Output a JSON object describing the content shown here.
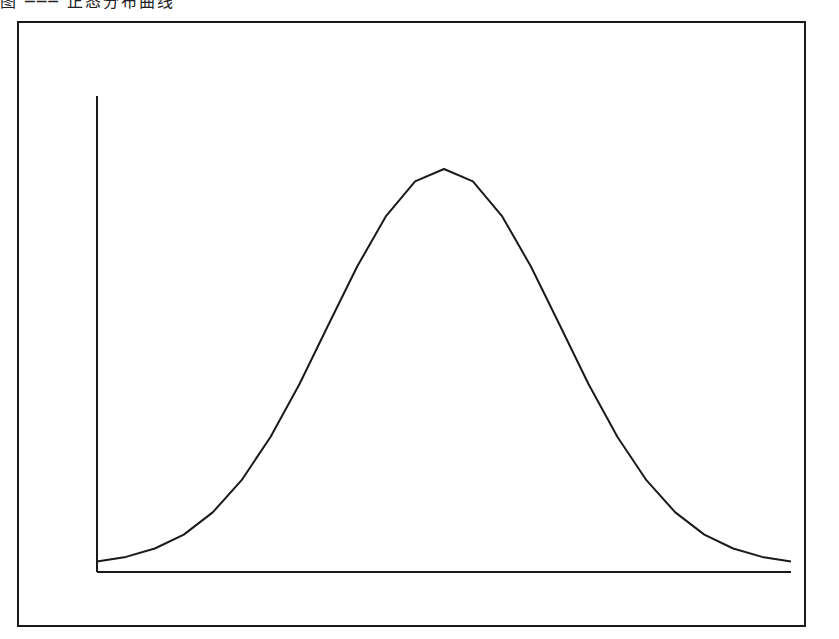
{
  "caption": "图 ─── 正态分布曲线",
  "colors": {
    "line": "#1a1a1a",
    "frame": "#1a1a1a",
    "background": "#ffffff"
  },
  "chart_data": {
    "type": "line",
    "title": "",
    "xlabel": "",
    "ylabel": "",
    "grid": false,
    "legend": null,
    "x": [
      -3.0,
      -2.75,
      -2.5,
      -2.25,
      -2.0,
      -1.75,
      -1.5,
      -1.25,
      -1.0,
      -0.75,
      -0.5,
      -0.25,
      0.0,
      0.25,
      0.5,
      0.75,
      1.0,
      1.25,
      1.5,
      1.75,
      2.0,
      2.25,
      2.5,
      2.75,
      3.0
    ],
    "values": [
      0.011,
      0.023,
      0.044,
      0.079,
      0.135,
      0.216,
      0.325,
      0.458,
      0.607,
      0.755,
      0.882,
      0.969,
      1.0,
      0.969,
      0.882,
      0.755,
      0.607,
      0.458,
      0.325,
      0.216,
      0.135,
      0.079,
      0.044,
      0.023,
      0.011
    ],
    "xlim": [
      -3.0,
      3.0
    ],
    "ylim": [
      0,
      1.0
    ],
    "layout": {
      "frame": {
        "x": 18,
        "y": 22,
        "w": 787,
        "h": 604
      },
      "axis_origin": {
        "x": 97,
        "y": 572
      },
      "axis_x_end": 791,
      "axis_y_top": 96,
      "plot_y_peak": 169
    }
  }
}
